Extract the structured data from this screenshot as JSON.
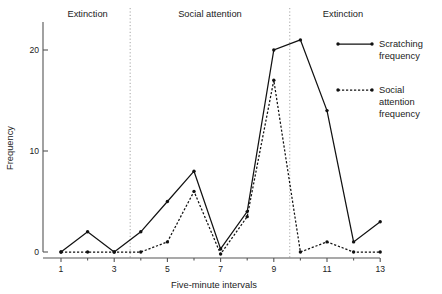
{
  "chart_data": {
    "type": "line",
    "title": "",
    "xlabel": "Five-minute intervals",
    "ylabel": "Frequency",
    "x": [
      1,
      2,
      3,
      4,
      5,
      6,
      7,
      8,
      9,
      10,
      11,
      12,
      13
    ],
    "xticks": [
      1,
      3,
      5,
      7,
      9,
      11,
      13
    ],
    "xtick_labels": [
      "1",
      "3",
      "5",
      "7",
      "9",
      "11",
      "13"
    ],
    "yticks": [
      0,
      10,
      20
    ],
    "ytick_labels": [
      "0",
      "10",
      "20"
    ],
    "xlim": [
      0.4,
      13.6
    ],
    "ylim": [
      -1,
      22
    ],
    "grid": false,
    "legend_position": "right",
    "series": [
      {
        "name": "Scratching frequency",
        "style": "solid",
        "marker": "dot",
        "values": [
          0,
          2,
          0,
          2,
          5,
          8,
          0.3,
          4,
          20,
          21,
          14,
          1,
          3
        ]
      },
      {
        "name": "Social attention frequency",
        "style": "dotted",
        "marker": "dot",
        "values": [
          0,
          0,
          0,
          0,
          1,
          6,
          -0.2,
          3.5,
          17,
          0,
          1,
          0,
          0
        ]
      }
    ],
    "phases": [
      {
        "label": "Extinction",
        "x_start": 0.4,
        "x_end": 3.6
      },
      {
        "label": "Social attention",
        "x_start": 3.6,
        "x_end": 9.6
      },
      {
        "label": "Extinction",
        "x_start": 9.6,
        "x_end": 13.6
      }
    ],
    "dividers": [
      3.6,
      9.6
    ]
  },
  "legend": {
    "entries": [
      {
        "label_line1": "Scratching",
        "label_line2": "frequency",
        "style": "solid"
      },
      {
        "label_line1": "Social",
        "label_line2": "attention",
        "label_line3": "frequency",
        "style": "dotted"
      }
    ]
  },
  "colors": {
    "ink": "#111111",
    "axis": "#555555",
    "divider": "#9a9a9a",
    "background": "#ffffff"
  }
}
